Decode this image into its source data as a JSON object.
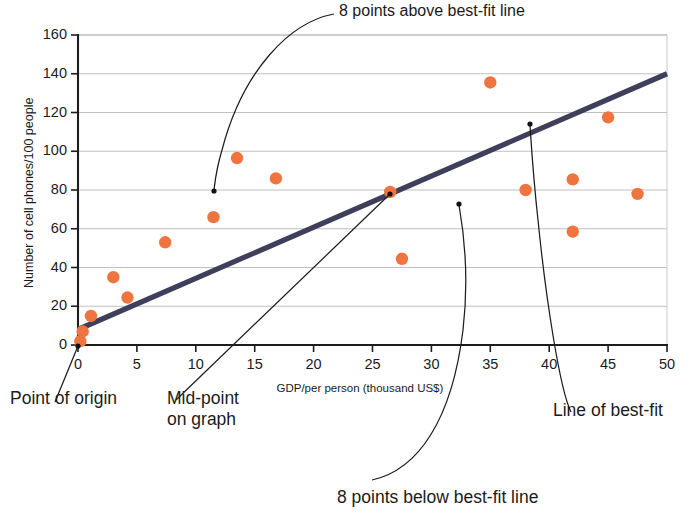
{
  "chart_data": {
    "type": "scatter",
    "title": "",
    "xlabel": "GDP/per person (thousand US$)",
    "ylabel": "Number of cell phones/100 people",
    "xlim": [
      0,
      50
    ],
    "ylim": [
      0,
      160
    ],
    "xticks": [
      0,
      5,
      10,
      15,
      20,
      25,
      30,
      35,
      40,
      45,
      50
    ],
    "yticks": [
      0,
      20,
      40,
      60,
      80,
      100,
      120,
      140,
      160
    ],
    "grid": "horizontal",
    "legend": "none",
    "marker_color": "#ee7540",
    "line_color": "#3f3f5c",
    "points": [
      {
        "x": 0.2,
        "y": 2
      },
      {
        "x": 0.4,
        "y": 7
      },
      {
        "x": 1.1,
        "y": 15
      },
      {
        "x": 3.0,
        "y": 35
      },
      {
        "x": 4.2,
        "y": 24.5
      },
      {
        "x": 7.4,
        "y": 53
      },
      {
        "x": 11.5,
        "y": 66
      },
      {
        "x": 13.5,
        "y": 96.5
      },
      {
        "x": 16.8,
        "y": 86
      },
      {
        "x": 26.5,
        "y": 79
      },
      {
        "x": 27.5,
        "y": 44.5
      },
      {
        "x": 35.0,
        "y": 135.5
      },
      {
        "x": 38.0,
        "y": 80
      },
      {
        "x": 42.0,
        "y": 85.5
      },
      {
        "x": 42.0,
        "y": 58.5
      },
      {
        "x": 45.0,
        "y": 117.5
      },
      {
        "x": 47.5,
        "y": 78
      }
    ],
    "best_fit_line": {
      "label": "Line of best-fit",
      "x0": 0,
      "y0": 8,
      "x1": 50,
      "y1": 140
    },
    "markers": [
      {
        "name": "point-of-origin",
        "x": 0,
        "y": 0
      },
      {
        "name": "mid-point-on-graph",
        "x": 26.5,
        "y": 77
      },
      {
        "name": "above-line-pointer",
        "x": 11.4,
        "y": 79
      },
      {
        "name": "below-line-pointer",
        "x": 34.5,
        "y": 76
      },
      {
        "name": "best-fit-pointer",
        "x": 38.3,
        "y": 113
      }
    ]
  },
  "annotations": {
    "above": "8 points above best-fit line",
    "below": "8 points below best-fit line",
    "origin": "Point of origin",
    "midpoint_line1": "Mid-point",
    "midpoint_line2": "on graph",
    "bestfit": "Line of best-fit"
  },
  "axes": {
    "x_title": "GDP/per person (thousand US$)",
    "y_title": "Number of cell phones/100 people",
    "x_tick_labels": [
      "0",
      "5",
      "10",
      "15",
      "20",
      "25",
      "30",
      "35",
      "40",
      "45",
      "50"
    ],
    "y_tick_labels": [
      "0",
      "20",
      "40",
      "60",
      "80",
      "100",
      "120",
      "140",
      "160"
    ]
  }
}
